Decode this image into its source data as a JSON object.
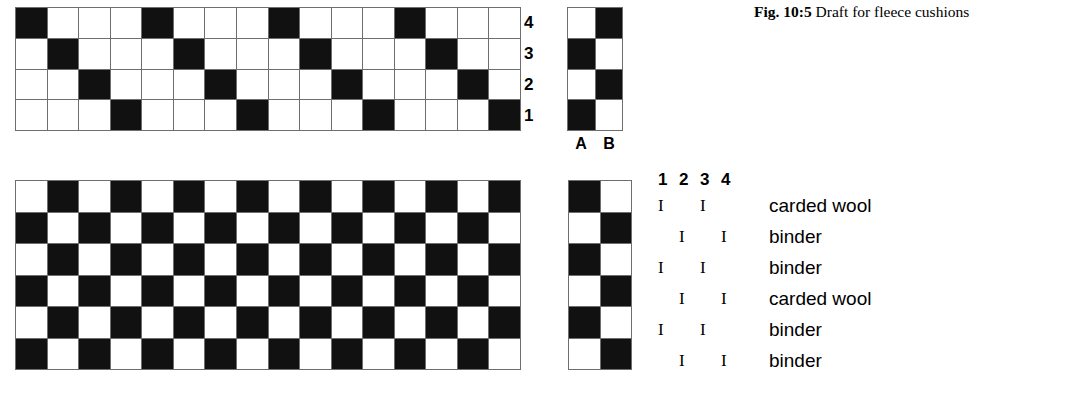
{
  "caption": {
    "prefix": "Fig.",
    "number": "10:5",
    "text": "Draft for fleece cushions"
  },
  "threading": {
    "name": "threading-draft",
    "columns": 16,
    "rows": 4,
    "shaft_labels": [
      "4",
      "3",
      "2",
      "1"
    ],
    "cells": [
      [
        1,
        0,
        0,
        0,
        1,
        0,
        0,
        0,
        1,
        0,
        0,
        0,
        1,
        0,
        0,
        0
      ],
      [
        0,
        1,
        0,
        0,
        0,
        1,
        0,
        0,
        0,
        1,
        0,
        0,
        0,
        1,
        0,
        0
      ],
      [
        0,
        0,
        1,
        0,
        0,
        0,
        1,
        0,
        0,
        0,
        1,
        0,
        0,
        0,
        1,
        0
      ],
      [
        0,
        0,
        0,
        1,
        0,
        0,
        0,
        1,
        0,
        0,
        0,
        1,
        0,
        0,
        0,
        1
      ]
    ]
  },
  "tieup": {
    "name": "tie-up",
    "columns": 2,
    "rows": 4,
    "column_labels": [
      "A",
      "B"
    ],
    "cells": [
      [
        0,
        1
      ],
      [
        1,
        0
      ],
      [
        0,
        1
      ],
      [
        1,
        0
      ]
    ]
  },
  "drawdown": {
    "name": "drawdown",
    "columns": 16,
    "rows": 6,
    "cells": [
      [
        0,
        1,
        0,
        1,
        0,
        1,
        0,
        1,
        0,
        1,
        0,
        1,
        0,
        1,
        0,
        1
      ],
      [
        1,
        0,
        1,
        0,
        1,
        0,
        1,
        0,
        1,
        0,
        1,
        0,
        1,
        0,
        1,
        0
      ],
      [
        0,
        1,
        0,
        1,
        0,
        1,
        0,
        1,
        0,
        1,
        0,
        1,
        0,
        1,
        0,
        1
      ],
      [
        1,
        0,
        1,
        0,
        1,
        0,
        1,
        0,
        1,
        0,
        1,
        0,
        1,
        0,
        1,
        0
      ],
      [
        0,
        1,
        0,
        1,
        0,
        1,
        0,
        1,
        0,
        1,
        0,
        1,
        0,
        1,
        0,
        1
      ],
      [
        1,
        0,
        1,
        0,
        1,
        0,
        1,
        0,
        1,
        0,
        1,
        0,
        1,
        0,
        1,
        0
      ]
    ]
  },
  "treadling_strip": {
    "name": "treadling-strip",
    "columns": 2,
    "rows": 6,
    "cells": [
      [
        1,
        0
      ],
      [
        0,
        1
      ],
      [
        1,
        0
      ],
      [
        0,
        1
      ],
      [
        1,
        0
      ],
      [
        0,
        1
      ]
    ]
  },
  "treadling_key": {
    "headers": [
      "1",
      "2",
      "3",
      "4"
    ],
    "mark_glyph": "I",
    "rows": [
      {
        "marks": [
          1,
          0,
          1,
          0
        ],
        "yarn": "carded wool"
      },
      {
        "marks": [
          0,
          1,
          0,
          1
        ],
        "yarn": "binder"
      },
      {
        "marks": [
          1,
          0,
          1,
          0
        ],
        "yarn": "binder"
      },
      {
        "marks": [
          0,
          1,
          0,
          1
        ],
        "yarn": "carded wool"
      },
      {
        "marks": [
          1,
          0,
          1,
          0
        ],
        "yarn": "binder"
      },
      {
        "marks": [
          0,
          1,
          0,
          1
        ],
        "yarn": "binder"
      }
    ]
  },
  "colors": {
    "filled": "#111111",
    "empty": "#ffffff",
    "gridline": "#6e6e6e"
  }
}
